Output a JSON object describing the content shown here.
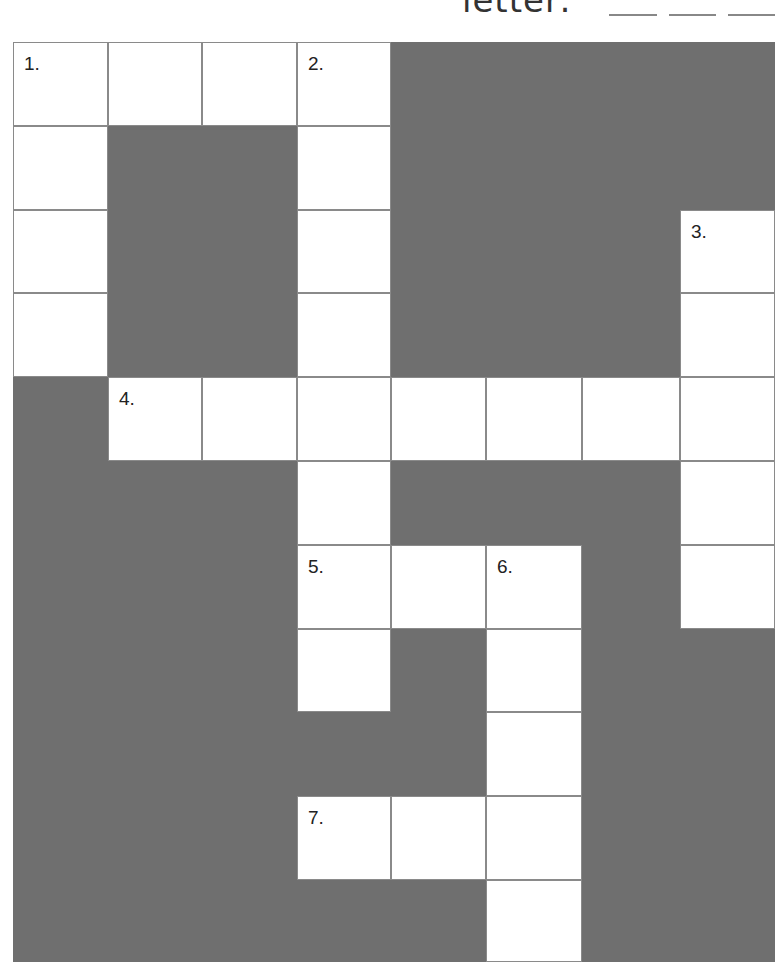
{
  "header": {
    "text": "a letter:",
    "blanks": 3
  },
  "colors": {
    "block": "#6f6f6f",
    "cell": "#ffffff",
    "line": "#8a8a8a"
  },
  "crossword": {
    "columns": 8,
    "rows": 11,
    "cells": [
      {
        "r": 0,
        "c": 0,
        "num": "1."
      },
      {
        "r": 0,
        "c": 1
      },
      {
        "r": 0,
        "c": 2
      },
      {
        "r": 0,
        "c": 3,
        "num": "2."
      },
      {
        "r": 1,
        "c": 0
      },
      {
        "r": 1,
        "c": 3
      },
      {
        "r": 2,
        "c": 0
      },
      {
        "r": 2,
        "c": 3
      },
      {
        "r": 2,
        "c": 7,
        "num": "3."
      },
      {
        "r": 3,
        "c": 0
      },
      {
        "r": 3,
        "c": 3
      },
      {
        "r": 3,
        "c": 7
      },
      {
        "r": 4,
        "c": 1,
        "num": "4."
      },
      {
        "r": 4,
        "c": 2
      },
      {
        "r": 4,
        "c": 3
      },
      {
        "r": 4,
        "c": 4
      },
      {
        "r": 4,
        "c": 5
      },
      {
        "r": 4,
        "c": 6
      },
      {
        "r": 4,
        "c": 7
      },
      {
        "r": 5,
        "c": 3
      },
      {
        "r": 5,
        "c": 7
      },
      {
        "r": 6,
        "c": 3,
        "num": "5."
      },
      {
        "r": 6,
        "c": 4
      },
      {
        "r": 6,
        "c": 5,
        "num": "6."
      },
      {
        "r": 6,
        "c": 7
      },
      {
        "r": 7,
        "c": 3
      },
      {
        "r": 7,
        "c": 5
      },
      {
        "r": 8,
        "c": 5
      },
      {
        "r": 9,
        "c": 3,
        "num": "7."
      },
      {
        "r": 9,
        "c": 4
      },
      {
        "r": 9,
        "c": 5
      },
      {
        "r": 10,
        "c": 5
      }
    ],
    "clue_numbers": [
      "1.",
      "2.",
      "3.",
      "4.",
      "5.",
      "6.",
      "7."
    ]
  }
}
